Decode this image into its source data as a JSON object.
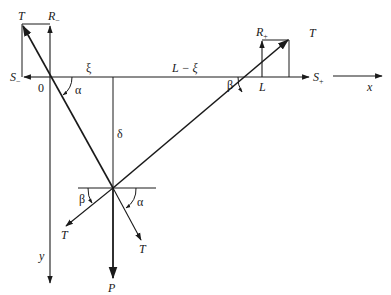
{
  "diagram": {
    "type": "free-body force diagram of a cable under point load",
    "labels": {
      "origin": "0",
      "xi": "ξ",
      "L_minus_xi": "L − ξ",
      "L": "L",
      "delta": "δ",
      "alpha_top": "α",
      "beta_top": "β",
      "alpha_bottom": "α",
      "beta_bottom": "β",
      "x_axis": "x",
      "y_axis": "y",
      "P": "P",
      "T_left_top": "T",
      "T_right_top": "T",
      "T_bottom_left": "T",
      "T_bottom_right": "T",
      "R_minus": "R",
      "R_minus_sub": "−",
      "R_plus": "R",
      "R_plus_sub": "+",
      "S_minus": "S",
      "S_minus_sub": "−",
      "S_plus": "S",
      "S_plus_sub": "+"
    },
    "colors": {
      "stroke": "#1a1a1a",
      "background": "#ffffff"
    }
  }
}
